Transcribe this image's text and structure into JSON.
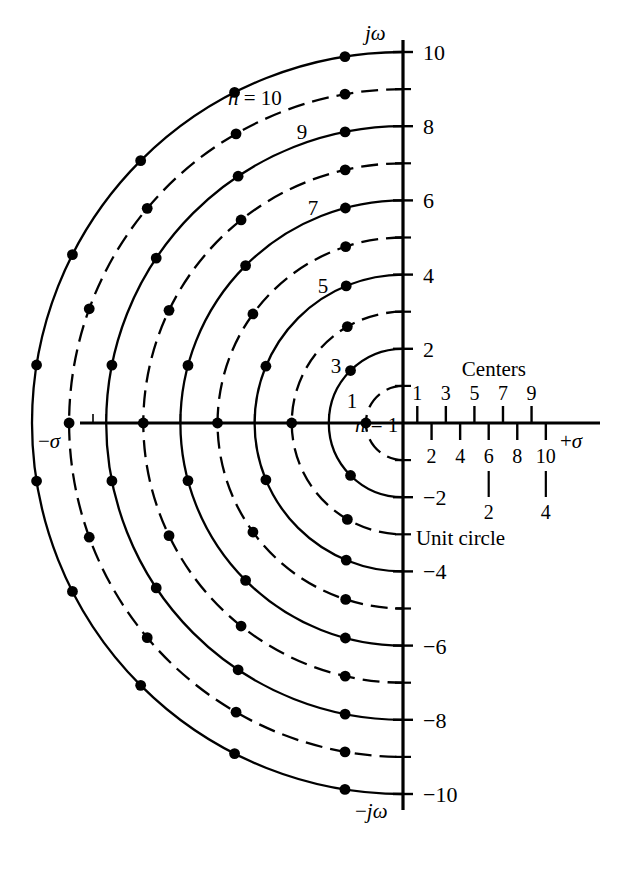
{
  "figure": {
    "axes": {
      "vertical_positive_label": "jω",
      "vertical_negative_label": "−jω",
      "horizontal_negative_label": "−σ",
      "horizontal_positive_label": "+σ",
      "vertical_tick_labels": [
        "10",
        "8",
        "6",
        "4",
        "2",
        "−2",
        "−4",
        "−6",
        "−8",
        "−10"
      ],
      "vertical_tick_values": [
        10,
        8,
        6,
        4,
        2,
        -2,
        -4,
        -6,
        -8,
        -10
      ],
      "vertical_minor_ticks": [
        9,
        7,
        5,
        3,
        1,
        -1,
        -3,
        -5,
        -7,
        -9
      ],
      "origin_label": ""
    },
    "annotations": {
      "centers_heading": "Centers",
      "unit_circle_label": "Unit circle",
      "n_equals_10": "n = 10",
      "n_equals_1": "n = 1",
      "curve_labels": [
        "9",
        "7",
        "5",
        "3",
        "1"
      ],
      "centers_odd": [
        "1",
        "3",
        "5",
        "7",
        "9"
      ],
      "centers_even": [
        "2",
        "4",
        "6",
        "8",
        "10"
      ],
      "unit_circle_marks": [
        "2",
        "4"
      ],
      "sigma_italic": "σ",
      "omega_italic": "ω",
      "n_italic": "n"
    }
  },
  "chart_data": {
    "type": "scatter",
    "xlabel": "σ",
    "ylabel": "jω",
    "xlim": [
      -11.5,
      5.8
    ],
    "ylim": [
      -11.2,
      11.2
    ],
    "grid": false,
    "legend": "none",
    "arcs": [
      {
        "n": 1,
        "radius": 1,
        "style": "dashed",
        "label": "n = 1"
      },
      {
        "n": 2,
        "radius": 2,
        "style": "solid",
        "label": ""
      },
      {
        "n": 3,
        "radius": 3,
        "style": "dashed",
        "label": "1"
      },
      {
        "n": 4,
        "radius": 4,
        "style": "solid",
        "label": ""
      },
      {
        "n": 5,
        "radius": 5,
        "style": "dashed",
        "label": "3"
      },
      {
        "n": 6,
        "radius": 6,
        "style": "solid",
        "label": ""
      },
      {
        "n": 7,
        "radius": 7,
        "style": "dashed",
        "label": "5"
      },
      {
        "n": 8,
        "radius": 8,
        "style": "solid",
        "label": ""
      },
      {
        "n": 9,
        "radius": 9,
        "style": "dashed",
        "label": "7"
      },
      {
        "n": 10,
        "radius": 10,
        "style": "solid",
        "label": "9"
      },
      {
        "n": 11,
        "radius": 11,
        "style": "solid",
        "label": "n = 10"
      }
    ],
    "orders": [
      {
        "order": 1,
        "radius": 1,
        "arc_style": "dashed",
        "pole_count": 1
      },
      {
        "order": 2,
        "radius": 2,
        "arc_style": "solid",
        "pole_count": 2
      },
      {
        "order": 3,
        "radius": 3,
        "arc_style": "dashed",
        "pole_count": 3
      },
      {
        "order": 4,
        "radius": 4,
        "arc_style": "solid",
        "pole_count": 4
      },
      {
        "order": 5,
        "radius": 5,
        "arc_style": "dashed",
        "pole_count": 5
      },
      {
        "order": 6,
        "radius": 6,
        "arc_style": "solid",
        "pole_count": 6
      },
      {
        "order": 7,
        "radius": 7,
        "arc_style": "dashed",
        "pole_count": 7
      },
      {
        "order": 8,
        "radius": 8,
        "arc_style": "solid",
        "pole_count": 8
      },
      {
        "order": 9,
        "radius": 9,
        "arc_style": "dashed",
        "pole_count": 9
      },
      {
        "order": 10,
        "radius": 10,
        "arc_style": "solid",
        "pole_count": 10
      }
    ],
    "centers_scale": {
      "odd": [
        1,
        3,
        5,
        7,
        9
      ],
      "even": [
        2,
        4,
        6,
        8,
        10
      ],
      "tick_values": [
        1,
        2,
        3,
        4,
        5,
        6,
        7,
        8,
        9,
        10
      ],
      "unit_circle_pointers": [
        {
          "at": 6,
          "label": "2"
        },
        {
          "at": 10,
          "label": "4"
        }
      ]
    },
    "colors": {
      "ink": "#000000",
      "background": "#ffffff"
    }
  }
}
